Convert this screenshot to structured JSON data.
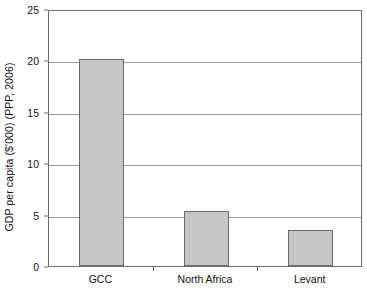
{
  "chart_data": {
    "type": "bar",
    "title": "",
    "subtitle": "",
    "xlabel": "",
    "ylabel": "GDP per capita ($'000) (PPP, 2006)",
    "categories": [
      "GCC",
      "North Africa",
      "Levant"
    ],
    "values": [
      20.1,
      5.4,
      3.5
    ],
    "series": [
      {
        "name": "GDP per capita",
        "values": [
          20.1,
          5.4,
          3.5
        ]
      }
    ],
    "ylim": [
      0,
      25
    ],
    "xlim": [
      0,
      3
    ],
    "y_ticks": [
      0,
      5,
      10,
      15,
      20,
      25
    ],
    "y_tick_labels": [
      "0",
      "5",
      "10",
      "15",
      "20",
      "25"
    ],
    "x_tick_labels": [
      "GCC",
      "North Africa",
      "Levant"
    ],
    "grid": true,
    "grid_axis": "y",
    "legend": false,
    "legend_position": "none",
    "annotations": [],
    "colors": {
      "bar_fill": "#c6c6c6",
      "bar_border": "#6a6a6a",
      "gridline": "#9a9a9a",
      "axis": "#6e6e6e",
      "text": "#111111",
      "background": "#ffffff"
    }
  }
}
